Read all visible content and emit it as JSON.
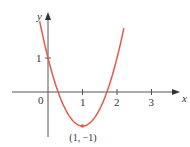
{
  "chart_data": {
    "type": "line",
    "title": "",
    "xlabel": "x",
    "ylabel": "y",
    "function": "y = 2(x - 1)^2 - 1",
    "x_ticks": [
      "0",
      "1",
      "2",
      "3"
    ],
    "y_ticks": [
      "1"
    ],
    "x_range": [
      -1,
      3.8
    ],
    "y_range": [
      -1.3,
      2.3
    ],
    "grid": false,
    "series": [
      {
        "name": "parabola",
        "color": "#e05a4f",
        "points": [
          [
            -0.24,
            2.0
          ],
          [
            0,
            1
          ],
          [
            0.5,
            -0.5
          ],
          [
            1,
            -1
          ],
          [
            1.5,
            -0.5
          ],
          [
            2,
            1
          ],
          [
            2.2,
            1.88
          ]
        ]
      }
    ],
    "annotations": [
      {
        "text": "(1, −1)",
        "x": 1,
        "y": -1,
        "position": "below"
      }
    ]
  },
  "labels": {
    "x_axis": "x",
    "y_axis": "y",
    "origin": "0",
    "x_tick_1": "1",
    "x_tick_2": "2",
    "x_tick_3": "3",
    "y_tick_1": "1",
    "vertex": "(1, −1)"
  },
  "colors": {
    "axis": "#555555",
    "curve": "#e05a4f",
    "text": "#333333"
  }
}
